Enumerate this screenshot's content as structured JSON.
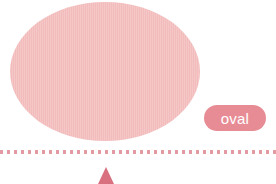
{
  "canvas": {
    "width": 276,
    "height": 184,
    "background": "#ffffff"
  },
  "shape": {
    "name": "oval",
    "kind": "ellipse",
    "fill": "#f3bcbc",
    "texture": "vertical-hatch",
    "bounds": {
      "x": 10,
      "y": 2,
      "width": 190,
      "height": 139
    }
  },
  "label": {
    "text": "oval",
    "text_color": "#ffffff",
    "pill_color": "#e78c95",
    "bounds": {
      "x": 204,
      "y": 105,
      "width": 62,
      "height": 26
    }
  },
  "divider": {
    "style": "dotted",
    "color": "#e29ba2",
    "y": 150,
    "dot_size": 3,
    "dot_gap": 4
  },
  "pointer": {
    "kind": "triangle-up",
    "color": "#d9707f",
    "center_x": 106,
    "y": 167,
    "width": 16,
    "height": 17
  }
}
